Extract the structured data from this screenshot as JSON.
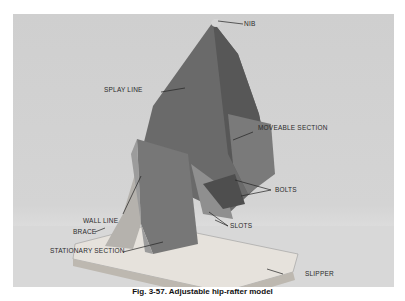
{
  "figure": {
    "caption": "Fig. 3-57. Adjustable hip-rafter model",
    "labels": {
      "nib": "NIB",
      "splay_line": "SPLAY LINE",
      "moveable_section": "MOVEABLE SECTION",
      "bolts": "BOLTS",
      "wall_line": "WALL LINE",
      "brace": "BRACE",
      "slots": "SLOTS",
      "stationary_section": "STATIONARY SECTION",
      "slipper": "SLIPPER"
    }
  }
}
